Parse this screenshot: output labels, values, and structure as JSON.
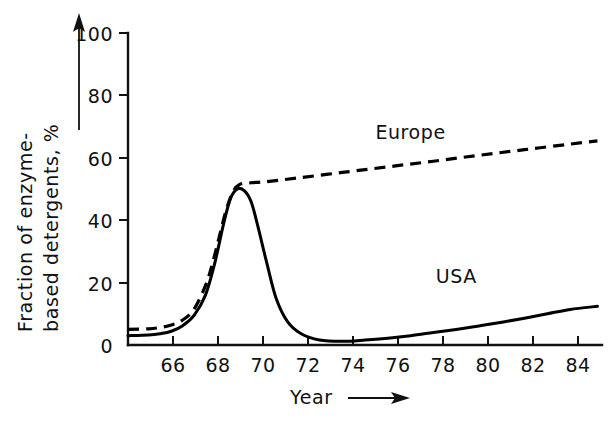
{
  "chart_data": {
    "type": "line",
    "title": "",
    "xlabel": "Year",
    "ylabel": "Fraction of enzyme-based detergents, %",
    "xlim": [
      64.6,
      85.4
    ],
    "ylim": [
      0,
      100
    ],
    "grid": false,
    "legend_position": "inline-annotations",
    "x_ticks": [
      66,
      68,
      70,
      72,
      74,
      76,
      78,
      80,
      82,
      84
    ],
    "x_tick_labels": [
      "66",
      "68",
      "70",
      "72",
      "74",
      "76",
      "78",
      "80",
      "82",
      "84"
    ],
    "y_ticks": [
      0,
      20,
      40,
      60,
      80,
      100
    ],
    "y_tick_labels": [
      "0",
      "20",
      "40",
      "60",
      "80",
      "100"
    ],
    "annotations": [
      {
        "text": "Europe",
        "x": 77.0,
        "y": 66.0
      },
      {
        "text": "USA",
        "x": 79.0,
        "y": 20.0
      }
    ],
    "series": [
      {
        "name": "Europe",
        "style": "dashed",
        "x": [
          64.6,
          65.5,
          66.0,
          66.5,
          67.0,
          67.5,
          68.0,
          68.3,
          68.6,
          68.9,
          69.2,
          69.5,
          70.0,
          70.6,
          72.0,
          74.0,
          76.0,
          78.0,
          80.0,
          82.0,
          84.0,
          85.2
        ],
        "y": [
          5.0,
          5.2,
          5.6,
          6.4,
          8.0,
          11.5,
          19.0,
          26.0,
          34.5,
          43.0,
          49.0,
          51.5,
          52.0,
          52.3,
          53.5,
          55.3,
          57.1,
          58.9,
          60.8,
          62.6,
          64.4,
          65.4
        ]
      },
      {
        "name": "USA",
        "style": "solid",
        "x": [
          64.6,
          65.5,
          66.0,
          66.5,
          67.0,
          67.5,
          68.0,
          68.4,
          68.8,
          69.1,
          69.4,
          69.7,
          70.0,
          70.3,
          70.7,
          71.1,
          71.6,
          72.2,
          73.0,
          74.0,
          75.0,
          76.0,
          77.0,
          78.0,
          79.0,
          80.0,
          81.0,
          82.0,
          83.0,
          84.0,
          85.2
        ],
        "y": [
          3.0,
          3.2,
          3.6,
          4.4,
          6.2,
          9.5,
          16.0,
          26.0,
          39.0,
          47.0,
          50.0,
          49.5,
          46.0,
          38.0,
          26.0,
          15.0,
          7.5,
          3.6,
          1.6,
          1.2,
          1.6,
          2.2,
          3.0,
          4.0,
          5.0,
          6.1,
          7.3,
          8.6,
          10.0,
          11.4,
          12.4
        ]
      }
    ]
  },
  "axes": {
    "y_axis_arrow_label": "Fraction of enzyme-based detergents, %",
    "x_axis_arrow_label": "Year"
  }
}
